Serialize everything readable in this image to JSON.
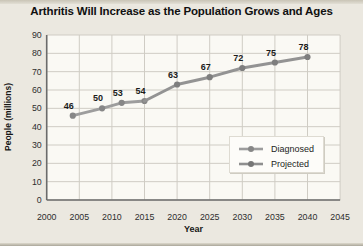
{
  "chart_data": {
    "type": "line",
    "title": "Arthritis Will Increase as the Population Grows and Ages",
    "xlabel": "Year",
    "ylabel": "People (millions)",
    "xlim": [
      2000,
      2045
    ],
    "ylim": [
      0,
      90
    ],
    "xticks": [
      2000,
      2005,
      2010,
      2015,
      2020,
      2025,
      2030,
      2035,
      2040,
      2045
    ],
    "yticks": [
      0,
      10,
      20,
      30,
      40,
      50,
      60,
      70,
      80,
      90
    ],
    "grid": true,
    "legend_position": "inside-lower-right",
    "series": [
      {
        "name": "Diagnosed",
        "color": "#9d9d9d",
        "marker_color": "#878787",
        "points": [
          {
            "x": 2004,
            "y": 46,
            "label": "46"
          },
          {
            "x": 2008.5,
            "y": 50,
            "label": "50"
          },
          {
            "x": 2011.5,
            "y": 53,
            "label": "53"
          },
          {
            "x": 2015,
            "y": 54,
            "label": "54"
          }
        ]
      },
      {
        "name": "Projected",
        "color": "#939393",
        "marker_color": "#7e7e7e",
        "points": [
          {
            "x": 2015,
            "y": 54,
            "connector": true
          },
          {
            "x": 2020,
            "y": 63,
            "label": "63"
          },
          {
            "x": 2025,
            "y": 67,
            "label": "67"
          },
          {
            "x": 2030,
            "y": 72,
            "label": "72"
          },
          {
            "x": 2035,
            "y": 75,
            "label": "75"
          },
          {
            "x": 2040,
            "y": 78,
            "label": "78"
          }
        ]
      }
    ],
    "colors": {
      "grid": "#cfccc4",
      "axis": "#6b6b6b",
      "tick_text": "#2e2e2e",
      "point_label_text": "#1b1b1b",
      "plot_bg": "#faf9f4"
    }
  }
}
